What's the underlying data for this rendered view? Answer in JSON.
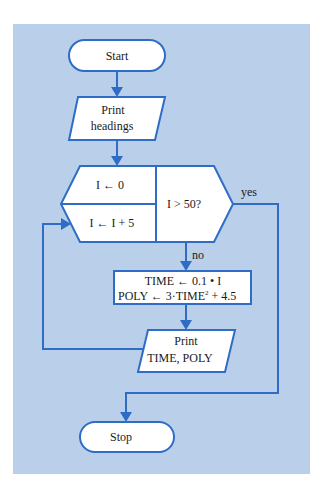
{
  "colors": {
    "background": "#bad0ea",
    "stroke": "#2e6cc6",
    "fill": "#ffffff"
  },
  "nodes": {
    "start": "Start",
    "print_headings": [
      "Print",
      "headings"
    ],
    "init": "I ← 0",
    "increment": "I ← I + 5",
    "decision": "I > 50?",
    "process_line1": "TIME ← 0.1 • I",
    "process_line2_a": "POLY ← 3·TIME",
    "process_line2_sup": "2",
    "process_line2_b": " + 4.5",
    "print_output": [
      "Print",
      "TIME, POLY"
    ],
    "stop": "Stop"
  },
  "edges": {
    "yes_label": "yes",
    "no_label": "no"
  }
}
